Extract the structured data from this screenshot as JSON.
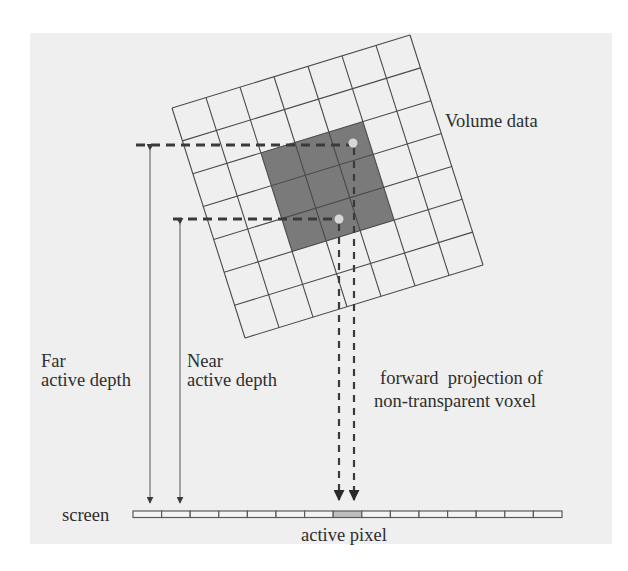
{
  "figure": {
    "labels": {
      "volume_data": "Volume data",
      "far_line1": "Far",
      "far_line2": "active depth",
      "near_line1": "Near",
      "near_line2": "active depth",
      "projection_line1": "forward  projection of",
      "projection_line2": "non-transparent voxel",
      "screen": "screen",
      "active_pixel": "active pixel"
    },
    "volume_grid": {
      "rows": 7,
      "cols": 7,
      "highlighted_block": {
        "col_start": 2,
        "row_start": 2,
        "size": 3
      },
      "rotation_note": "grid rotated ~17 degrees counter-clockwise"
    },
    "screen_bar": {
      "cells": 15,
      "active_cell_index": 7
    },
    "colors": {
      "panel_background": "#efefef",
      "grid_lines": "#4a4a4a",
      "highlighted_voxels": "#7a7a7a",
      "active_pixel": "#bdbdbd",
      "text": "#2e2e2e"
    }
  }
}
